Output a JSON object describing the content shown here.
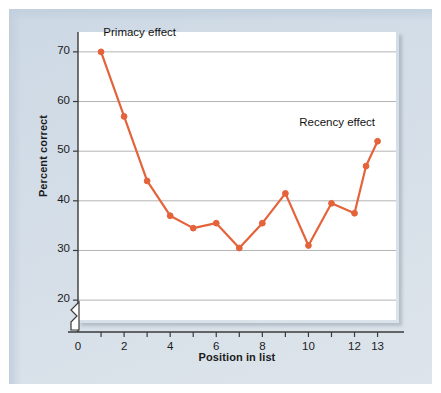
{
  "figure": {
    "panel_color": "#d3dde7",
    "plot_background": "#ffffff",
    "series_color": "#e4633a",
    "gridline_color": "#b4b4b4",
    "axis_color": "#3a3a3a"
  },
  "chart_data": {
    "type": "line",
    "title": "",
    "xlabel": "Position in list",
    "ylabel": "Percent correct",
    "xlim": [
      0,
      13.8
    ],
    "ylim": [
      16,
      74
    ],
    "grid": true,
    "y_axis_break": true,
    "legend_position": "none",
    "x_ticks": [
      0,
      1,
      2,
      3,
      4,
      5,
      6,
      7,
      8,
      9,
      10,
      11,
      12,
      13
    ],
    "x_tick_labels": [
      "0",
      "",
      "2",
      "",
      "4",
      "",
      "6",
      "",
      "8",
      "",
      "10",
      "",
      "12",
      "13"
    ],
    "y_ticks": [
      20,
      30,
      40,
      50,
      60,
      70
    ],
    "y_tick_labels": [
      "20",
      "30",
      "40",
      "50",
      "60",
      "70"
    ],
    "series": [
      {
        "name": "Percent correct recall by serial position",
        "color": "#e4633a",
        "marker": "circle",
        "x": [
          1,
          2,
          3,
          4,
          5,
          6,
          7,
          8,
          9,
          10,
          11,
          12,
          12.5,
          13
        ],
        "values": [
          70,
          57,
          44,
          37,
          34.5,
          35.5,
          30.5,
          35.5,
          41.5,
          31,
          39.5,
          37.5,
          47,
          52
        ]
      }
    ],
    "annotations": [
      {
        "text": "Primacy effect",
        "x": 1.1,
        "y": 73.5,
        "name": "primacy-effect-label"
      },
      {
        "text": "Recency effect",
        "x": 9.6,
        "y": 55.5,
        "name": "recency-effect-label"
      }
    ]
  }
}
